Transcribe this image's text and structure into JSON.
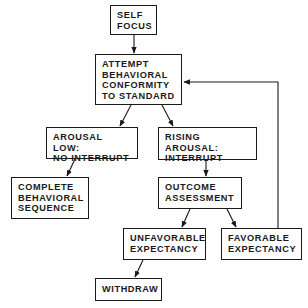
{
  "diagram": {
    "nodes": [
      {
        "id": "self_focus",
        "label": "SELF\nFOCUS"
      },
      {
        "id": "attempt",
        "label": "ATTEMPT\nBEHAVIORAL\nCONFORMITY\nTO STANDARD"
      },
      {
        "id": "arousal_low",
        "label": "AROUSAL LOW:\nNO INTERRUPT"
      },
      {
        "id": "rising_arousal",
        "label": "RISING AROUSAL:\nINTERRUPT"
      },
      {
        "id": "complete",
        "label": "COMPLETE\nBEHAVIORAL\nSEQUENCE"
      },
      {
        "id": "outcome",
        "label": "OUTCOME\nASSESSMENT"
      },
      {
        "id": "unfavorable",
        "label": "UNFAVORABLE\nEXPECTANCY"
      },
      {
        "id": "favorable",
        "label": "FAVORABLE\nEXPECTANCY"
      },
      {
        "id": "withdraw",
        "label": "WITHDRAW"
      }
    ],
    "edges": [
      {
        "from": "self_focus",
        "to": "attempt"
      },
      {
        "from": "attempt",
        "to": "arousal_low"
      },
      {
        "from": "attempt",
        "to": "rising_arousal"
      },
      {
        "from": "arousal_low",
        "to": "complete"
      },
      {
        "from": "rising_arousal",
        "to": "outcome"
      },
      {
        "from": "outcome",
        "to": "unfavorable"
      },
      {
        "from": "outcome",
        "to": "favorable"
      },
      {
        "from": "unfavorable",
        "to": "withdraw"
      },
      {
        "from": "favorable",
        "to": "attempt",
        "type": "feedback-loop"
      }
    ],
    "colors": {
      "line": "#1a1a1a",
      "background": "#ffffff"
    }
  }
}
